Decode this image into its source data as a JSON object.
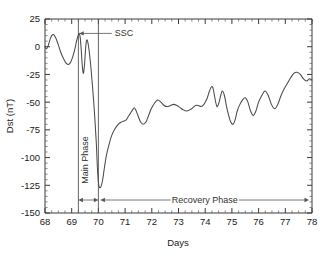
{
  "chart_data": {
    "type": "line",
    "title": "",
    "xlabel": "Days",
    "ylabel": "Dst (nT)",
    "xlim": [
      68,
      78
    ],
    "ylim": [
      -150,
      25
    ],
    "xticks": [
      68,
      69,
      70,
      71,
      72,
      73,
      74,
      75,
      76,
      77,
      78
    ],
    "yticks": [
      25,
      0,
      -25,
      -50,
      -75,
      -100,
      -125,
      -150
    ],
    "xtick_labels": [
      "68",
      "69",
      "70",
      "71",
      "72",
      "73",
      "74",
      "75",
      "76",
      "77",
      "78"
    ],
    "ytick_labels": [
      "25",
      "0",
      "-25",
      "-50",
      "-75",
      "-100",
      "-125",
      "-150"
    ],
    "grid": false,
    "legend": "none",
    "minor_ticks": true,
    "series": [
      {
        "name": "Dst index",
        "color": "#4a4a4a",
        "x": [
          68.0,
          68.06,
          68.12,
          68.18,
          68.25,
          68.32,
          68.4,
          68.48,
          68.56,
          68.64,
          68.72,
          68.8,
          68.88,
          68.96,
          69.04,
          69.12,
          69.18,
          69.24,
          69.28,
          69.32,
          69.36,
          69.4,
          69.44,
          69.48,
          69.52,
          69.56,
          69.62,
          69.7,
          69.78,
          69.86,
          69.92,
          69.96,
          70.0,
          70.04,
          70.1,
          70.16,
          70.22,
          70.3,
          70.4,
          70.5,
          70.62,
          70.74,
          70.86,
          70.96,
          71.04,
          71.12,
          71.2,
          71.28,
          71.34,
          71.4,
          71.48,
          71.58,
          71.68,
          71.78,
          71.88,
          71.98,
          72.1,
          72.22,
          72.34,
          72.46,
          72.58,
          72.7,
          72.82,
          72.94,
          73.06,
          73.18,
          73.3,
          73.42,
          73.54,
          73.64,
          73.74,
          73.84,
          73.92,
          74.0,
          74.08,
          74.16,
          74.24,
          74.3,
          74.36,
          74.44,
          74.52,
          74.58,
          74.64,
          74.72,
          74.8,
          74.88,
          74.96,
          75.04,
          75.12,
          75.2,
          75.3,
          75.4,
          75.5,
          75.6,
          75.7,
          75.8,
          75.9,
          76.0,
          76.12,
          76.24,
          76.36,
          76.48,
          76.6,
          76.72,
          76.84,
          76.96,
          77.08,
          77.2,
          77.32,
          77.44,
          77.56,
          77.68,
          77.8,
          77.9,
          78.0
        ],
        "y": [
          0,
          -2,
          1,
          6,
          10,
          11,
          8,
          3,
          -3,
          -8,
          -12,
          -15,
          -16,
          -14,
          -9,
          -2,
          5,
          10,
          12,
          8,
          -4,
          -18,
          -24,
          -16,
          -2,
          6,
          2,
          -14,
          -36,
          -62,
          -86,
          -108,
          -122,
          -127,
          -126,
          -120,
          -110,
          -98,
          -88,
          -80,
          -74,
          -70,
          -68,
          -67,
          -66,
          -63,
          -60,
          -57,
          -55,
          -57,
          -62,
          -68,
          -70,
          -68,
          -62,
          -56,
          -51,
          -48,
          -50,
          -53,
          -54,
          -53,
          -52,
          -53,
          -55,
          -57,
          -58,
          -57,
          -55,
          -53,
          -53,
          -54,
          -53,
          -50,
          -46,
          -40,
          -36,
          -38,
          -46,
          -54,
          -50,
          -44,
          -40,
          -44,
          -54,
          -62,
          -68,
          -70,
          -66,
          -58,
          -52,
          -48,
          -46,
          -50,
          -58,
          -62,
          -58,
          -50,
          -44,
          -40,
          -44,
          -52,
          -56,
          -52,
          -44,
          -38,
          -33,
          -28,
          -24,
          -23,
          -25,
          -29,
          -31,
          -29,
          -30
        ]
      }
    ],
    "annotations": [
      {
        "name": "ssc",
        "label": "SSC",
        "type": "arrow-label",
        "point_x": 69.28,
        "point_y": 12,
        "label_x": 70.5,
        "label_y": 12
      },
      {
        "name": "main-phase",
        "label": "Main Phase",
        "type": "span-vertical-label",
        "x_start": 69.25,
        "x_end": 70.0
      },
      {
        "name": "recovery-phase",
        "label": "Recovery Phase",
        "type": "span-label",
        "x_start": 70.0,
        "x_end": 78.0
      }
    ],
    "event_lines": [
      {
        "name": "storm-sudden-commencement-line",
        "x": 69.25
      },
      {
        "name": "main-phase-end-line",
        "x": 70.0
      }
    ],
    "colors": {
      "curve": "#4a4a4a",
      "axis": "#3a3a3a",
      "annotation": "#555555",
      "background": "#ffffff",
      "text": "#1a1a1a"
    }
  }
}
